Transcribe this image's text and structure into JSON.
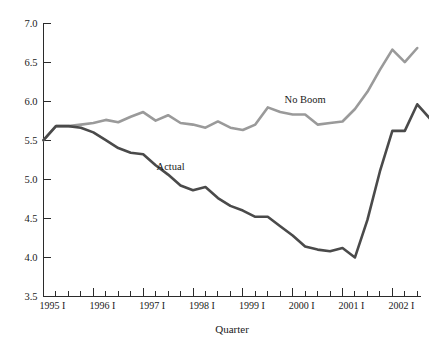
{
  "chart_data": {
    "type": "line",
    "title": "",
    "xlabel": "Quarter",
    "ylabel": "",
    "ylim": [
      3.5,
      7.0
    ],
    "yticks": [
      3.5,
      4.0,
      4.5,
      5.0,
      5.5,
      6.0,
      6.5,
      7.0
    ],
    "ytick_labels": [
      "3.5",
      "4.0",
      "4.5",
      "5.0",
      "5.5",
      "6.0",
      "6.5",
      "7.0"
    ],
    "grid": false,
    "legend_position": "inline-annotations",
    "x_tick_labels": [
      "1995 I",
      "1996 I",
      "1997 I",
      "1998 I",
      "1999 I",
      "2000 I",
      "2001 I",
      "2002 I"
    ],
    "x_major_tick_indices": [
      0,
      4,
      8,
      12,
      16,
      20,
      24,
      28
    ],
    "x": [
      "1995 I",
      "1995 II",
      "1995 III",
      "1995 IV",
      "1996 I",
      "1996 II",
      "1996 III",
      "1996 IV",
      "1997 I",
      "1997 II",
      "1997 III",
      "1997 IV",
      "1998 I",
      "1998 II",
      "1998 III",
      "1998 IV",
      "1999 I",
      "1999 II",
      "1999 III",
      "1999 IV",
      "2000 I",
      "2000 II",
      "2000 III",
      "2000 IV",
      "2001 I",
      "2001 II",
      "2001 III",
      "2001 IV",
      "2002 I",
      "2002 II",
      "2002 III"
    ],
    "series": [
      {
        "name": "No Boom",
        "color": "#9a9a9a",
        "stroke_width": 2.6,
        "annotation": "No Boom",
        "annotation_x": 21.0,
        "annotation_y": 5.98,
        "values": [
          5.5,
          5.68,
          5.68,
          5.7,
          5.72,
          5.76,
          5.73,
          5.8,
          5.86,
          5.75,
          5.82,
          5.72,
          5.7,
          5.66,
          5.74,
          5.66,
          5.63,
          5.7,
          5.92,
          5.86,
          5.83,
          5.83,
          5.7,
          5.72,
          5.74,
          5.9,
          6.12,
          6.4,
          6.66,
          6.5,
          6.68
        ]
      },
      {
        "name": "Actual",
        "color": "#4a4a4a",
        "stroke_width": 2.6,
        "annotation": "Actual",
        "annotation_x": 10.2,
        "annotation_y": 5.12,
        "values": [
          5.5,
          5.68,
          5.68,
          5.66,
          5.6,
          5.5,
          5.4,
          5.34,
          5.32,
          5.18,
          5.06,
          4.92,
          4.86,
          4.9,
          4.76,
          4.66,
          4.6,
          4.52,
          4.52,
          4.4,
          4.28,
          4.14,
          4.1,
          4.08,
          4.12,
          4.0,
          4.48,
          5.1,
          5.62,
          5.62,
          5.96
        ],
        "tail_values": [
          5.78
        ]
      }
    ],
    "series_tail_note": {
      "no_boom_final": 6.35,
      "actual_final": 5.78
    }
  },
  "axis": {
    "y_axis_name": "value-axis",
    "x_axis_name": "quarter-axis"
  }
}
